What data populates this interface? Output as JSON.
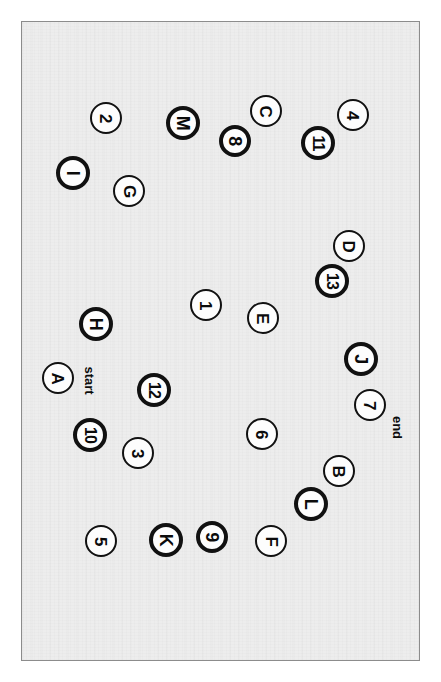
{
  "board": {
    "background_color": "#ededed",
    "border_color": "#8c8c8c",
    "orientation_note": "rotated-90"
  },
  "captions": [
    {
      "name": "start-label",
      "text": "start",
      "x": 88,
      "y": 380
    },
    {
      "name": "end-label",
      "text": "end",
      "x": 396,
      "y": 427
    }
  ],
  "tokens": [
    {
      "id": "tok-2",
      "label": "2",
      "x": 105,
      "y": 117,
      "r": 16,
      "weight": "thin"
    },
    {
      "id": "tok-M",
      "label": "M",
      "x": 182,
      "y": 122,
      "r": 17,
      "weight": "thick"
    },
    {
      "id": "tok-C",
      "label": "C",
      "x": 265,
      "y": 110,
      "r": 16,
      "weight": "thin"
    },
    {
      "id": "tok-4",
      "label": "4",
      "x": 352,
      "y": 114,
      "r": 16,
      "weight": "thin"
    },
    {
      "id": "tok-8",
      "label": "8",
      "x": 234,
      "y": 140,
      "r": 16,
      "weight": "thick"
    },
    {
      "id": "tok-11",
      "label": "11",
      "x": 317,
      "y": 142,
      "r": 17,
      "weight": "thick"
    },
    {
      "id": "tok-I",
      "label": "I",
      "x": 72,
      "y": 172,
      "r": 17,
      "weight": "thick"
    },
    {
      "id": "tok-G",
      "label": "G",
      "x": 128,
      "y": 190,
      "r": 16,
      "weight": "thin"
    },
    {
      "id": "tok-D",
      "label": "D",
      "x": 348,
      "y": 245,
      "r": 16,
      "weight": "thin"
    },
    {
      "id": "tok-13",
      "label": "13",
      "x": 331,
      "y": 280,
      "r": 17,
      "weight": "thick"
    },
    {
      "id": "tok-1",
      "label": "1",
      "x": 205,
      "y": 304,
      "r": 16,
      "weight": "thin"
    },
    {
      "id": "tok-E",
      "label": "E",
      "x": 262,
      "y": 317,
      "r": 16,
      "weight": "thin"
    },
    {
      "id": "tok-H",
      "label": "H",
      "x": 95,
      "y": 323,
      "r": 17,
      "weight": "thick"
    },
    {
      "id": "tok-J",
      "label": "J",
      "x": 360,
      "y": 358,
      "r": 17,
      "weight": "thick"
    },
    {
      "id": "tok-A",
      "label": "A",
      "x": 57,
      "y": 377,
      "r": 16,
      "weight": "thin"
    },
    {
      "id": "tok-12",
      "label": "12",
      "x": 153,
      "y": 389,
      "r": 17,
      "weight": "thick"
    },
    {
      "id": "tok-7",
      "label": "7",
      "x": 369,
      "y": 404,
      "r": 16,
      "weight": "thin"
    },
    {
      "id": "tok-6",
      "label": "6",
      "x": 261,
      "y": 433,
      "r": 16,
      "weight": "thin"
    },
    {
      "id": "tok-10",
      "label": "10",
      "x": 89,
      "y": 434,
      "r": 17,
      "weight": "thick"
    },
    {
      "id": "tok-3",
      "label": "3",
      "x": 137,
      "y": 452,
      "r": 16,
      "weight": "thin"
    },
    {
      "id": "tok-B",
      "label": "B",
      "x": 338,
      "y": 470,
      "r": 16,
      "weight": "thin"
    },
    {
      "id": "tok-L",
      "label": "L",
      "x": 310,
      "y": 503,
      "r": 17,
      "weight": "thick"
    },
    {
      "id": "tok-5",
      "label": "5",
      "x": 100,
      "y": 540,
      "r": 16,
      "weight": "thin"
    },
    {
      "id": "tok-K",
      "label": "K",
      "x": 165,
      "y": 539,
      "r": 17,
      "weight": "thick"
    },
    {
      "id": "tok-9",
      "label": "9",
      "x": 211,
      "y": 536,
      "r": 16,
      "weight": "thick"
    },
    {
      "id": "tok-F",
      "label": "F",
      "x": 270,
      "y": 540,
      "r": 16,
      "weight": "thin"
    }
  ]
}
